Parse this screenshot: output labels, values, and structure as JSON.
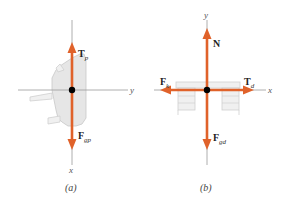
{
  "panel_a": {
    "caption": "(a)",
    "axes": {
      "horizontal": "y",
      "vertical": "x"
    },
    "forces": [
      {
        "symbol": "T",
        "subscript": "p",
        "direction": "up"
      },
      {
        "symbol": "F",
        "subscript": "gp",
        "direction": "down"
      }
    ],
    "object": "piano (viewed from side)"
  },
  "panel_b": {
    "caption": "(b)",
    "axes": {
      "horizontal": "x",
      "vertical": "y"
    },
    "forces": [
      {
        "symbol": "N",
        "subscript": "",
        "direction": "up"
      },
      {
        "symbol": "F",
        "subscript": "gd",
        "direction": "down"
      },
      {
        "symbol": "F",
        "subscript": "k",
        "direction": "left"
      },
      {
        "symbol": "T",
        "subscript": "d",
        "direction": "right"
      }
    ],
    "object": "desk"
  },
  "colors": {
    "force": "#e0622a",
    "axis": "#9a9a9a",
    "point": "#000000"
  }
}
